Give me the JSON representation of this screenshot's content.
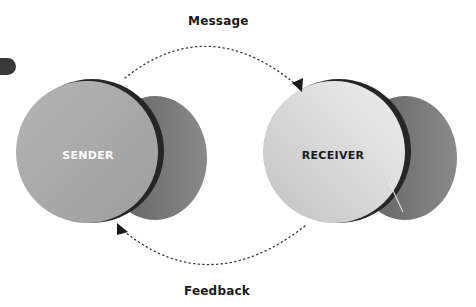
{
  "diagram": {
    "type": "communication-model",
    "nodes": [
      {
        "id": "sender",
        "label": "SENDER",
        "label_color": "#ffffff",
        "disk_color": "#a9a9a9",
        "rim_color": "#2b2b2b",
        "shadow_color": "#6e6e6e"
      },
      {
        "id": "receiver",
        "label": "RECEIVER",
        "label_color": "#1a1a1a",
        "disk_color": "#d8d8d8",
        "rim_color": "#2b2b2b",
        "shadow_color": "#7a7a7a"
      }
    ],
    "edges": [
      {
        "from": "sender",
        "to": "receiver",
        "label": "Message",
        "style": "dotted",
        "arrow": "end"
      },
      {
        "from": "receiver",
        "to": "sender",
        "label": "Feedback",
        "style": "dotted",
        "arrow": "end"
      }
    ],
    "decorations": [
      {
        "name": "partial-pill-shape",
        "color": "#3a3a3a"
      }
    ]
  }
}
